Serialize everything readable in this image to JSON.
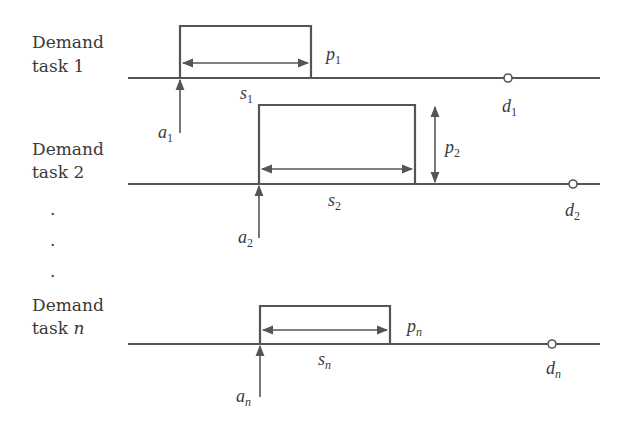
{
  "diagram": {
    "colors": {
      "stroke": "#555555",
      "text": "#3a3a3a",
      "background": "#ffffff"
    },
    "tasks": [
      {
        "label_line1": "Demand",
        "label_line2": "task 1",
        "label_line2_plain": "task ",
        "label_index": "1",
        "start_var": "s",
        "start_sub": "1",
        "proc_var": "p",
        "proc_sub": "1",
        "arrival_var": "a",
        "arrival_sub": "1",
        "deadline_var": "d",
        "deadline_sub": "1"
      },
      {
        "label_line1": "Demand",
        "label_line2": "task 2",
        "label_line2_plain": "task ",
        "label_index": "2",
        "start_var": "s",
        "start_sub": "2",
        "proc_var": "p",
        "proc_sub": "2",
        "arrival_var": "a",
        "arrival_sub": "2",
        "deadline_var": "d",
        "deadline_sub": "2"
      },
      {
        "label_line1": "Demand",
        "label_line2": "task n",
        "label_line2_plain": "task ",
        "label_index": "n",
        "start_var": "s",
        "start_sub": "n",
        "proc_var": "p",
        "proc_sub": "n",
        "arrival_var": "a",
        "arrival_sub": "n",
        "deadline_var": "d",
        "deadline_sub": "n"
      }
    ],
    "ellipsis_dots": [
      ".",
      ".",
      "."
    ]
  }
}
